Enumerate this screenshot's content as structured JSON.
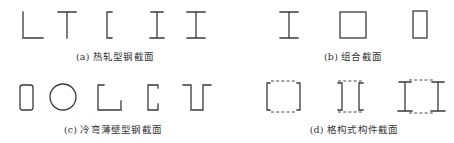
{
  "figure": {
    "panels": [
      {
        "id": "a",
        "caption": "(a) 热轧型钢截面",
        "shapes": [
          "angle-section",
          "tee-section",
          "channel-section",
          "i-beam-section",
          "h-beam-section"
        ]
      },
      {
        "id": "b",
        "caption": "(b) 组合截面",
        "shapes": [
          "welded-i-section",
          "square-box-section",
          "rectangular-box-section"
        ]
      },
      {
        "id": "c",
        "caption": "(c) 冷弯薄壁型钢截面",
        "shapes": [
          "rounded-rectangular-tube",
          "circular-tube",
          "cold-formed-angle",
          "lipped-channel",
          "hat-section"
        ]
      },
      {
        "id": "d",
        "caption": "(d) 格构式构件截面",
        "shapes": [
          "laced-double-channel-outward",
          "laced-double-channel-inward",
          "laced-double-i-section"
        ]
      }
    ],
    "colors": {
      "stroke": "#3a3a3a",
      "caption_text": "#333333",
      "background": "#ffffff"
    }
  }
}
